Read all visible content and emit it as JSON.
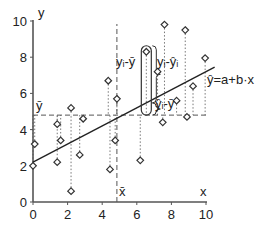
{
  "chart_data": {
    "type": "scatter",
    "title": "",
    "xlabel": "x",
    "ylabel": "y",
    "xlim": [
      0,
      10
    ],
    "ylim": [
      0,
      10
    ],
    "x_ticks": [
      0,
      2,
      4,
      6,
      8,
      10
    ],
    "y_ticks": [
      0,
      2,
      4,
      6,
      8,
      10
    ],
    "grid": false,
    "series": [
      {
        "name": "observations",
        "marker": "diamond-open",
        "points": [
          {
            "x": 0.0,
            "y": 2.0
          },
          {
            "x": 0.1,
            "y": 3.2
          },
          {
            "x": 1.4,
            "y": 4.3
          },
          {
            "x": 1.4,
            "y": 2.2
          },
          {
            "x": 1.6,
            "y": 3.4
          },
          {
            "x": 2.2,
            "y": 5.2
          },
          {
            "x": 2.2,
            "y": 0.6
          },
          {
            "x": 2.7,
            "y": 2.6
          },
          {
            "x": 2.9,
            "y": 4.6
          },
          {
            "x": 4.35,
            "y": 6.7
          },
          {
            "x": 4.45,
            "y": 1.8
          },
          {
            "x": 4.75,
            "y": 3.4
          },
          {
            "x": 4.85,
            "y": 5.7
          },
          {
            "x": 6.2,
            "y": 2.3
          },
          {
            "x": 6.55,
            "y": 8.3
          },
          {
            "x": 7.2,
            "y": 7.2
          },
          {
            "x": 7.5,
            "y": 4.4
          },
          {
            "x": 7.6,
            "y": 9.8
          },
          {
            "x": 8.3,
            "y": 5.6
          },
          {
            "x": 8.8,
            "y": 9.5
          },
          {
            "x": 8.9,
            "y": 4.7
          },
          {
            "x": 9.25,
            "y": 6.4
          },
          {
            "x": 9.95,
            "y": 7.95
          }
        ]
      }
    ],
    "regression_line": {
      "intercept": 2.2,
      "slope": 0.5,
      "x_from": 0,
      "x_to": 10.5,
      "label": "ŷ=a+b·x"
    },
    "mean_lines": {
      "x_bar": 4.85,
      "y_bar": 4.8,
      "x_bar_label": "x̄",
      "y_bar_label": "ȳ"
    },
    "annotations": [
      {
        "text": "yᵢ-ȳ",
        "meaning": "total deviation"
      },
      {
        "text": "yᵢ-ŷᵢ",
        "meaning": "residual"
      },
      {
        "text": "ŷᵢ-ȳ",
        "meaning": "explained deviation"
      }
    ],
    "highlighted_point": {
      "x": 6.55,
      "y": 8.3
    },
    "legend": null
  },
  "labels": {
    "x_axis": "x",
    "y_axis": "y",
    "y_bar": "ȳ",
    "x_bar": "x̄",
    "equation": "ŷ=a+b·x",
    "total_dev": "yᵢ-ȳ",
    "residual": "yᵢ-ŷᵢ",
    "explained": "ŷᵢ-ȳ",
    "ticks_x": [
      "0",
      "2",
      "4",
      "6",
      "8",
      "10"
    ],
    "ticks_y": [
      "0",
      "2",
      "4",
      "6",
      "8",
      "10"
    ]
  }
}
